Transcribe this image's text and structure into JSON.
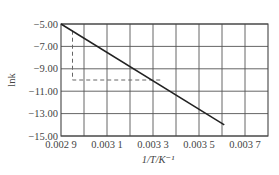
{
  "chart_data": {
    "type": "line",
    "title": "",
    "xlabel": "1/T/K⁻¹",
    "ylabel": "lnk",
    "xlim": [
      0.0029,
      0.0038
    ],
    "ylim": [
      -15.0,
      -5.0
    ],
    "x_ticks": [
      0.0029,
      0.0031,
      0.0033,
      0.0035,
      0.0037
    ],
    "x_tick_labels": [
      "0.002 9",
      "0.003 1",
      "0.003 3",
      "0.003 5",
      "0.003 7"
    ],
    "y_ticks": [
      -5.0,
      -7.0,
      -9.0,
      -11.0,
      -13.0,
      -15.0
    ],
    "y_tick_labels": [
      "−5.00",
      "−7.00",
      "−9.00",
      "−11.00",
      "−13.00",
      "−15.00"
    ],
    "grid": true,
    "grid_x_step": 0.0001,
    "legend": null,
    "series": [
      {
        "name": "lnk vs 1/T",
        "style": "solid",
        "x": [
          0.0029,
          0.00361
        ],
        "y": [
          -5.0,
          -14.0
        ]
      }
    ],
    "annotations": [
      {
        "type": "dashed-guide",
        "points": [
          [
            0.00295,
            -5.6
          ],
          [
            0.00295,
            -10.0
          ],
          [
            0.00334,
            -10.0
          ]
        ]
      }
    ]
  }
}
